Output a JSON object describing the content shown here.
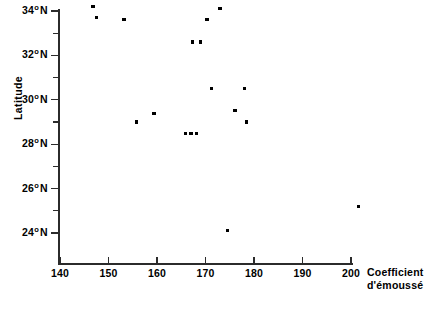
{
  "chart_data": {
    "type": "scatter",
    "title": "",
    "xlabel": "Coefficient d'émoussé",
    "ylabel": "Latitude",
    "xlabel_lines": [
      "Coefficient",
      "d'émoussé"
    ],
    "xlim": [
      138,
      204
    ],
    "ylim": [
      23.0,
      34.6
    ],
    "grid": false,
    "legend": null,
    "x_ticks": [
      {
        "value": 140,
        "label": "140"
      },
      {
        "value": 150,
        "label": "150"
      },
      {
        "value": 160,
        "label": "160"
      },
      {
        "value": 170,
        "label": "170"
      },
      {
        "value": 180,
        "label": "180"
      },
      {
        "value": 190,
        "label": "190"
      },
      {
        "value": 200,
        "label": "200"
      }
    ],
    "y_ticks": [
      {
        "value": 34,
        "label": "34",
        "degree": "o",
        "suffix": "N"
      },
      {
        "value": 32,
        "label": "32",
        "degree": "o",
        "suffix": "N"
      },
      {
        "value": 30,
        "label": "30",
        "degree": "o",
        "suffix": "N"
      },
      {
        "value": 28,
        "label": "28",
        "degree": "o",
        "suffix": "N"
      },
      {
        "value": 26,
        "label": "26",
        "degree": "o",
        "suffix": "N"
      },
      {
        "value": 24,
        "label": "24",
        "degree": "o",
        "suffix": "N"
      }
    ],
    "y_minor_ticks": [
      33,
      31,
      29,
      27,
      25
    ],
    "points": [
      {
        "x": 146.8,
        "y": 34.2
      },
      {
        "x": 147.6,
        "y": 33.7
      },
      {
        "x": 153.2,
        "y": 33.6
      },
      {
        "x": 170.3,
        "y": 33.6
      },
      {
        "x": 173.0,
        "y": 34.1
      },
      {
        "x": 167.4,
        "y": 32.6
      },
      {
        "x": 168.9,
        "y": 32.6
      },
      {
        "x": 171.3,
        "y": 30.5
      },
      {
        "x": 178.1,
        "y": 30.5
      },
      {
        "x": 159.4,
        "y": 29.4
      },
      {
        "x": 176.1,
        "y": 29.5
      },
      {
        "x": 155.7,
        "y": 29.0
      },
      {
        "x": 178.4,
        "y": 29.0
      },
      {
        "x": 165.8,
        "y": 28.5
      },
      {
        "x": 167.0,
        "y": 28.5
      },
      {
        "x": 168.2,
        "y": 28.5
      },
      {
        "x": 174.6,
        "y": 24.1
      },
      {
        "x": 201.6,
        "y": 25.2
      }
    ],
    "marker_color": "#000000",
    "axis_color": "#2b2b2b",
    "background_color": "#ffffff"
  }
}
